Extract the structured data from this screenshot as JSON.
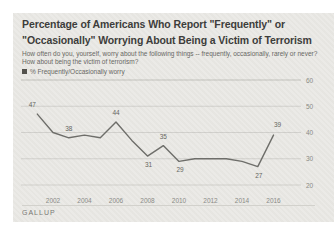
{
  "card": {
    "title": "Percentage of Americans Who Report \"Frequently\" or \"Occasionally\" Worrying About Being a Victim of Terrorism",
    "subtitle": "How often do you, yourself, worry about the following things -- frequently, occasionally, rarely or never? How about being the victim of terrorism?",
    "legend": {
      "swatch_color": "#53524d",
      "label": "% Frequently/Occasionally worry"
    },
    "source": "GALLUP"
  },
  "chart_data": {
    "type": "line",
    "title": "Percentage of Americans Who Report \"Frequently\" or \"Occasionally\" Worrying About Being a Victim of Terrorism",
    "xlabel": "",
    "ylabel": "% Frequently/Occasionally worry",
    "x": [
      2001,
      2002,
      2003,
      2004,
      2005,
      2006,
      2007,
      2008,
      2009,
      2010,
      2011,
      2012,
      2013,
      2014,
      2015,
      2016
    ],
    "values": [
      47,
      40,
      38,
      39,
      38,
      44,
      37,
      31,
      35,
      29,
      30,
      30,
      30,
      29,
      27,
      39
    ],
    "point_labels": [
      {
        "x": 2001,
        "value": 47,
        "pos": "above-left"
      },
      {
        "x": 2003,
        "value": 38,
        "pos": "above"
      },
      {
        "x": 2006,
        "value": 44,
        "pos": "above"
      },
      {
        "x": 2008,
        "value": 31,
        "pos": "below"
      },
      {
        "x": 2009,
        "value": 35,
        "pos": "above"
      },
      {
        "x": 2010,
        "value": 29,
        "pos": "below"
      },
      {
        "x": 2015,
        "value": 27,
        "pos": "below"
      },
      {
        "x": 2016,
        "value": 39,
        "pos": "above-right"
      }
    ],
    "xticks": [
      2002,
      2004,
      2006,
      2008,
      2010,
      2012,
      2014,
      2016
    ],
    "yticks": [
      20,
      30,
      40,
      50,
      60
    ],
    "ylim": [
      20,
      60
    ],
    "grid": true,
    "legend_position": "top-left",
    "line_color": "#6e6e6a",
    "grid_color": "#64645f",
    "tick_label_color": "#8a8a86",
    "point_label_color": "#66665f"
  }
}
